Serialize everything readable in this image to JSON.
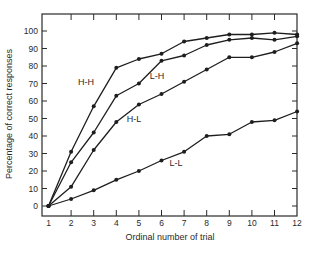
{
  "chart_data": {
    "type": "line",
    "title": "",
    "xlabel": "Ordinal number of trial",
    "ylabel": "Percentage of correct responses",
    "x": [
      1,
      2,
      3,
      4,
      5,
      6,
      7,
      8,
      9,
      10,
      11,
      12
    ],
    "xticks": [
      "1",
      "2",
      "3",
      "4",
      "5",
      "6",
      "7",
      "8",
      "9",
      "10",
      "11",
      "12"
    ],
    "yticks": [
      "0",
      "10",
      "20",
      "30",
      "40",
      "50",
      "60",
      "70",
      "80",
      "90",
      "100"
    ],
    "xlim": [
      1,
      12
    ],
    "ylim": [
      0,
      100
    ],
    "grid": false,
    "legend": "inline labels",
    "series": [
      {
        "name": "H-H",
        "values": [
          0,
          31,
          57,
          79,
          84,
          87,
          94,
          96,
          98,
          98,
          99,
          98
        ],
        "label_pos": [
          86,
          85
        ]
      },
      {
        "name": "L-H",
        "values": [
          0,
          25,
          42,
          63,
          70,
          83,
          86,
          92,
          95,
          96,
          95,
          97
        ],
        "label_pos": [
          157,
          79
        ]
      },
      {
        "name": "H-L",
        "values": [
          0,
          11,
          32,
          48,
          58,
          64,
          71,
          78,
          85,
          85,
          88,
          93
        ],
        "label_pos": [
          134,
          122
        ]
      },
      {
        "name": "L-L",
        "values": [
          0,
          4,
          9,
          15,
          20,
          26,
          31,
          40,
          41,
          48,
          49,
          54
        ],
        "label_pos": [
          176,
          166
        ]
      }
    ]
  },
  "colors": {
    "line": "#1e1e1e",
    "axis": "#2a2a2a",
    "background": "#ffffff"
  }
}
